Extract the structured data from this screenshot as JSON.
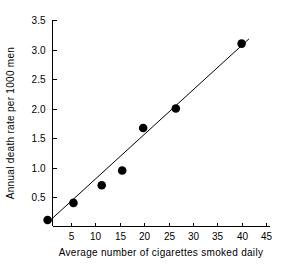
{
  "chart_data": {
    "type": "scatter",
    "title": "",
    "xlabel": "Average number of cigarettes smoked daily",
    "ylabel": "Annual death rate per 1000 men",
    "xlim": [
      0,
      45
    ],
    "ylim": [
      0,
      3.5
    ],
    "grid": false,
    "legend": null,
    "xticks": [
      5,
      10,
      15,
      20,
      25,
      30,
      35,
      40,
      45
    ],
    "xtick_labels": [
      "5",
      "10",
      "15",
      "20",
      "25",
      "30",
      "35",
      "40",
      "45"
    ],
    "yticks": [
      0.5,
      1.0,
      1.5,
      2.0,
      2.5,
      3.0,
      3.5
    ],
    "ytick_labels": [
      "0.5",
      "1.0",
      "1.5",
      "2.0",
      "2.5",
      "3.0",
      "3.5"
    ],
    "x": [
      0.2,
      5.5,
      11.3,
      15.5,
      19.8,
      26.5,
      40.0
    ],
    "y": [
      0.11,
      0.4,
      0.7,
      0.95,
      1.67,
      2.0,
      3.1
    ],
    "points": [
      {
        "x": 0.2,
        "y": 0.11
      },
      {
        "x": 5.5,
        "y": 0.4
      },
      {
        "x": 11.3,
        "y": 0.7
      },
      {
        "x": 15.5,
        "y": 0.95
      },
      {
        "x": 19.8,
        "y": 1.67
      },
      {
        "x": 26.5,
        "y": 2.0
      },
      {
        "x": 40.0,
        "y": 3.1
      }
    ],
    "marker": "filled-circle",
    "marker_size": 5,
    "marker_color": "#000000",
    "trendline": {
      "type": "linear-fit",
      "x_start": 0.0,
      "y_start": 0.05,
      "x_end": 41.5,
      "y_end": 3.18,
      "color": "#000000"
    }
  },
  "axes": {
    "x_axis_label": "Average number of cigarettes smoked daily",
    "y_axis_label": "Annual death rate per 1000 men"
  }
}
